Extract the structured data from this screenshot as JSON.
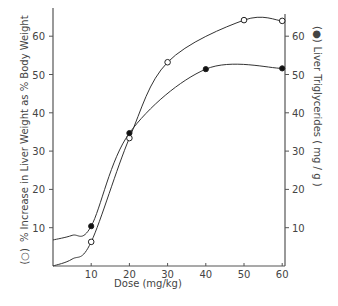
{
  "chart_data": {
    "type": "line",
    "title": "",
    "xlabel": "Dose  (mg/kg)",
    "ylabel_left": "% Increase in Liver Weight as % Body Weight",
    "ylabel_left_marker": "(○)",
    "ylabel_right": "Liver Triglycerides  ( mg / g )",
    "ylabel_right_marker": "(●)",
    "xlim": [
      0,
      62
    ],
    "ylim_left": [
      0,
      66
    ],
    "ylim_right": [
      0,
      66
    ],
    "x_ticks": [
      10,
      20,
      30,
      40,
      50,
      60
    ],
    "y_ticks_left": [
      10,
      20,
      30,
      40,
      50,
      60
    ],
    "y_ticks_right": [
      10,
      20,
      30,
      40,
      50,
      60
    ],
    "grid": false,
    "legend": "axis-label markers (open circle = left axis, filled circle = right axis)",
    "series": [
      {
        "name": "% Increase in Liver Weight as % Body Weight",
        "marker": "open-circle",
        "axis": "left",
        "x": [
          10,
          20,
          30,
          50,
          60
        ],
        "values": [
          6.3,
          33.4,
          53.2,
          64.2,
          64.0
        ],
        "curve_start": [
          0,
          0
        ]
      },
      {
        "name": "Liver Triglycerides (mg/g)",
        "marker": "filled-circle",
        "axis": "right",
        "x": [
          10,
          20,
          40,
          60
        ],
        "values": [
          10.4,
          34.7,
          51.4,
          51.6
        ],
        "curve_start": [
          0,
          6.8
        ]
      }
    ]
  }
}
